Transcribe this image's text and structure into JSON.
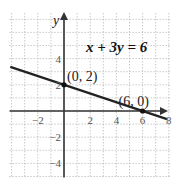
{
  "chart_data": {
    "type": "line",
    "title": "",
    "equation_label": "x + 3y = 6",
    "xlabel": "",
    "ylabel": "y",
    "xlim": [
      -4,
      8
    ],
    "ylim": [
      -5,
      7
    ],
    "grid": true,
    "grid_step": 1,
    "x_tick_labels": [
      "−2",
      "2",
      "4",
      "6",
      "8"
    ],
    "x_tick_values": [
      -2,
      2,
      4,
      6,
      8
    ],
    "y_tick_labels": [
      "4",
      "2",
      "−2",
      "−4"
    ],
    "y_tick_values": [
      4,
      2,
      -2,
      -4
    ],
    "series": [
      {
        "name": "x + 3y = 6",
        "x": [
          -4,
          8
        ],
        "y": [
          3.333,
          -0.667
        ],
        "color": "#222222"
      }
    ],
    "points": [
      {
        "x": 0,
        "y": 2,
        "label": "(0, 2)"
      },
      {
        "x": 6,
        "y": 0,
        "label": "(6, 0)"
      }
    ]
  }
}
